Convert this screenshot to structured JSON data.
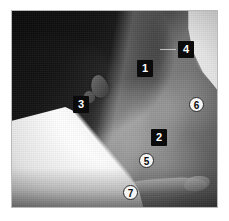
{
  "figure": {
    "kind": "anatomical-photograph",
    "view": "lateral view of head and neck",
    "frame_border_color": "#b9b9b9",
    "background_color": "#ffffff"
  },
  "markers": {
    "square_style": {
      "fill": "#0b0b0b",
      "text_color": "#ffffff"
    },
    "circle_style": {
      "fill": "#f4f4f4",
      "text_color": "#0b0b0b",
      "border_color": "#2a2a2a"
    },
    "items": [
      {
        "id": "marker-1",
        "label": "1",
        "shape": "square",
        "x": 125,
        "y": 49
      },
      {
        "id": "marker-2",
        "label": "2",
        "shape": "square",
        "x": 139,
        "y": 118
      },
      {
        "id": "marker-3",
        "label": "3",
        "shape": "square",
        "x": 61,
        "y": 85
      },
      {
        "id": "marker-4",
        "label": "4",
        "shape": "square",
        "x": 166,
        "y": 30
      },
      {
        "id": "marker-5",
        "label": "5",
        "shape": "circle",
        "x": 127,
        "y": 142
      },
      {
        "id": "marker-6",
        "label": "6",
        "shape": "circle",
        "x": 177,
        "y": 86
      },
      {
        "id": "marker-7",
        "label": "7",
        "shape": "circle",
        "x": 111,
        "y": 174
      }
    ]
  }
}
